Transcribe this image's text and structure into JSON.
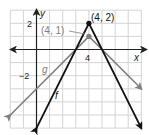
{
  "chart_data": {
    "type": "line",
    "title": "",
    "xlabel": "x",
    "ylabel": "y",
    "xlim": [
      -2,
      8
    ],
    "ylim": [
      -6,
      3
    ],
    "grid": true,
    "x_ticks_labeled": [
      {
        "value": 4,
        "label": "4"
      }
    ],
    "y_ticks_labeled": [
      {
        "value": 2,
        "label": "2"
      },
      {
        "value": -2,
        "label": "−2"
      }
    ],
    "series": [
      {
        "name": "f",
        "equation": "f(x) = -2|x - 4| + 2",
        "color": "#111111",
        "points": [
          [
            0,
            -6
          ],
          [
            4,
            2
          ],
          [
            8,
            -6
          ]
        ],
        "vertex": [
          4,
          2
        ],
        "vertex_label": "(4, 2)"
      },
      {
        "name": "g",
        "equation": "g(x) = -|x - 4| + 1",
        "color": "#808080",
        "points": [
          [
            -2,
            -5
          ],
          [
            4,
            1
          ],
          [
            8,
            -3
          ]
        ],
        "vertex": [
          4,
          1
        ],
        "vertex_label": "(4, 1)"
      }
    ],
    "annotations": [
      "(4, 2)",
      "(4, 1)",
      "f",
      "g"
    ]
  },
  "labels": {
    "x_axis": "x",
    "y_axis": "y",
    "tick_x4": "4",
    "tick_y2": "2",
    "tick_yneg2": "−2",
    "f": "f",
    "g": "g",
    "vertex_f": "(4, 2)",
    "vertex_g": "(4, 1)"
  }
}
